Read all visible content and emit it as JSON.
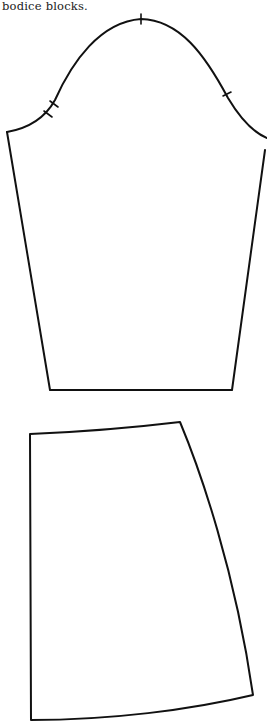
{
  "caption": "bodice blocks.",
  "figures": [
    {
      "name": "sleeve-block",
      "notches": 4
    },
    {
      "name": "skirt-block",
      "notches": 0
    }
  ]
}
